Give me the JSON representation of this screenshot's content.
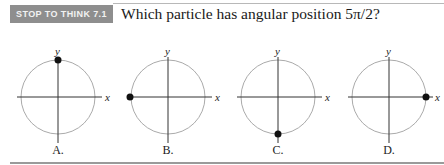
{
  "header": {
    "badge": "STOP TO THINK 7.1",
    "question": "Which particle has angular position 5π/2?"
  },
  "colors": {
    "badge_bg": "#8e8e8e",
    "circle": "#aaaaaa",
    "axis": "#333333",
    "particle": "#111111"
  },
  "options": [
    {
      "label": "A.",
      "x_axis_label": "x",
      "y_axis_label": "y",
      "particle_position": "top (positive y-axis)"
    },
    {
      "label": "B.",
      "x_axis_label": "x",
      "y_axis_label": "y",
      "particle_position": "left (negative x-axis)"
    },
    {
      "label": "C.",
      "x_axis_label": "x",
      "y_axis_label": "y",
      "particle_position": "bottom (negative y-axis)"
    },
    {
      "label": "D.",
      "x_axis_label": "x",
      "y_axis_label": "y",
      "particle_position": "right (positive x-axis)"
    }
  ]
}
